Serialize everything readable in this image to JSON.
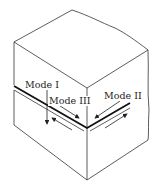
{
  "diagram": {
    "labels": {
      "mode1": "Mode I",
      "mode2": "Mode II",
      "mode3": "Mode III"
    },
    "colors": {
      "line": "#222222",
      "background": "#ffffff"
    }
  }
}
